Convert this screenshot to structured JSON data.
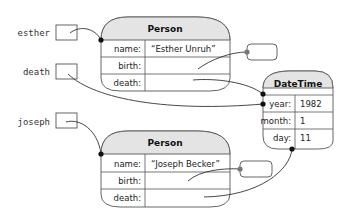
{
  "variables": [
    {
      "name": "esther"
    },
    {
      "name": "death"
    },
    {
      "name": "joseph"
    }
  ],
  "objects": {
    "person1": {
      "title": "Person",
      "fields": [
        {
          "label": "name:",
          "value": "“Esther Unruh”"
        },
        {
          "label": "birth:",
          "value": ""
        },
        {
          "label": "death:",
          "value": ""
        }
      ]
    },
    "datetime": {
      "title": "DateTime",
      "fields": [
        {
          "label": "year:",
          "value": "1982"
        },
        {
          "label": "month:",
          "value": "1"
        },
        {
          "label": "day:",
          "value": "11"
        }
      ]
    },
    "person2": {
      "title": "Person",
      "fields": [
        {
          "label": "name:",
          "value": "“Joseph Becker”"
        },
        {
          "label": "birth:",
          "value": ""
        },
        {
          "label": "death:",
          "value": ""
        }
      ]
    }
  },
  "colors": {
    "header_fill": "#e4e4e4",
    "stroke": "#555555",
    "dot": "#111111",
    "gray_dot": "#777777"
  }
}
